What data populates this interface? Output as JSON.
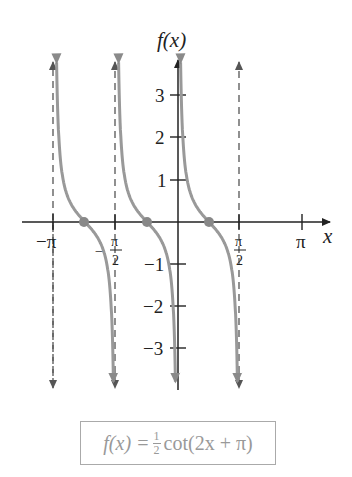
{
  "chart_data": {
    "type": "line",
    "function": "f(x) = (1/2) cot(2x + pi)",
    "xlabel": "x",
    "ylabel": "f(x)",
    "x_ticks": [
      "-π",
      "-π/2",
      "π/2",
      "π"
    ],
    "x_tick_values": [
      -3.1416,
      -1.5708,
      1.5708,
      3.1416
    ],
    "y_ticks": [
      "-3",
      "-2",
      "-1",
      "1",
      "2",
      "3"
    ],
    "y_tick_values": [
      -3,
      -2,
      -1,
      1,
      2,
      3
    ],
    "xlim": [
      -3.8,
      3.8
    ],
    "ylim": [
      -4.0,
      4.0
    ],
    "asymptotes": [
      -3.1416,
      -1.5708,
      0,
      1.5708
    ],
    "zeros": [
      -2.3562,
      -0.7854,
      0.7854
    ],
    "series": [
      {
        "name": "branch 1",
        "x_range": [
          -3.1416,
          -1.5708
        ],
        "zero_at": -2.3562
      },
      {
        "name": "branch 2",
        "x_range": [
          -1.5708,
          0
        ],
        "zero_at": -0.7854
      },
      {
        "name": "branch 3",
        "x_range": [
          0,
          1.5708
        ],
        "zero_at": 0.7854
      }
    ],
    "grid": false,
    "legend": "none"
  },
  "labels": {
    "y_axis": "f(x)",
    "x_axis": "x",
    "x_ticks": {
      "neg_pi": "−π",
      "neg_half_num": "π",
      "neg_half_den": "2",
      "half_num": "π",
      "half_den": "2",
      "pi": "π"
    },
    "y_ticks": {
      "p3": "3",
      "p2": "2",
      "p1": "1",
      "n1": "−1",
      "n2": "−2",
      "n3": "−3"
    }
  },
  "caption": {
    "lhs": "f(x) = ",
    "frac_num": "1",
    "frac_den": "2",
    "rhs": " cot(2x + π)"
  },
  "colors": {
    "axis": "#222222",
    "curve": "#9a9a9a",
    "asymptote": "#555555",
    "zero_point": "#888888"
  }
}
